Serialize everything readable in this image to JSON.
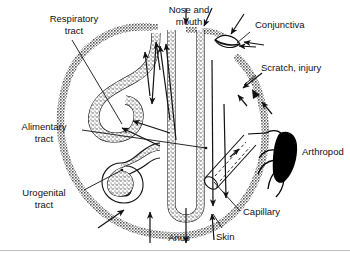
{
  "figure": {
    "type": "anatomical-schematic",
    "background_color": "#ffffff",
    "ink_color": "#111111",
    "outline_color": "#8a8a8a",
    "mucosa_fill": "#ffffff",
    "mucosa_stipple_color": "#2b2b2b",
    "arthropod_color": "#000000",
    "border": {
      "bottom_rule": true,
      "color": "#bfbfbf"
    }
  },
  "labels": {
    "respiratory_tract": "Respiratory\ntract",
    "respiratory_tract_line1": "Respiratory",
    "respiratory_tract_line2": "tract",
    "nose_and_mouth_line1": "Nose and",
    "nose_and_mouth_line2": "mouth",
    "conjunctiva": "Conjunctiva",
    "scratch_injury": "Scratch, injury",
    "alimentary_tract_line1": "Alimentary",
    "alimentary_tract_line2": "tract",
    "urogenital_tract_line1": "Urogenital",
    "urogenital_tract_line2": "tract",
    "arthropod": "Arthropod",
    "capillary": "Capillary",
    "skin": "Skin",
    "anus": "Anus"
  },
  "entry_routes": [
    {
      "id": "respiratory-tract",
      "label": "Respiratory tract",
      "side": "left"
    },
    {
      "id": "nose-and-mouth",
      "label": "Nose and mouth",
      "side": "top"
    },
    {
      "id": "conjunctiva",
      "label": "Conjunctiva",
      "side": "right"
    },
    {
      "id": "scratch-injury",
      "label": "Scratch, injury",
      "side": "right"
    },
    {
      "id": "alimentary-tract",
      "label": "Alimentary tract",
      "side": "left"
    },
    {
      "id": "urogenital-tract",
      "label": "Urogenital tract",
      "side": "left"
    },
    {
      "id": "arthropod",
      "label": "Arthropod",
      "side": "right"
    },
    {
      "id": "capillary",
      "label": "Capillary",
      "side": "right"
    },
    {
      "id": "skin",
      "label": "Skin",
      "side": "bottom"
    },
    {
      "id": "anus",
      "label": "Anus",
      "side": "bottom"
    }
  ]
}
